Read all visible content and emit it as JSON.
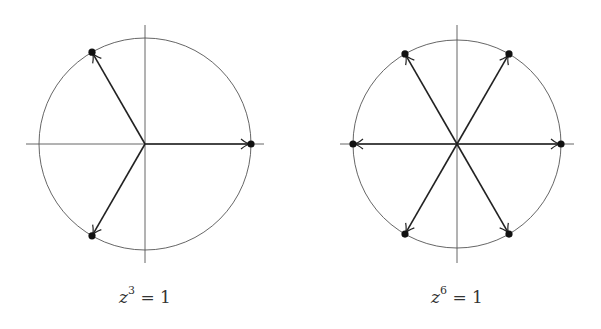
{
  "colors": {
    "circle": "#555555",
    "axis": "#555555",
    "arrow": "#222222",
    "point": "#111111",
    "background": "#ffffff"
  },
  "diagrams": [
    {
      "id": "cube-roots",
      "label": {
        "var": "z",
        "exp": "3",
        "rest": " = 1"
      },
      "n": 3,
      "center": [
        145,
        144
      ],
      "radius": 106,
      "points_deg": [
        0,
        120,
        240
      ]
    },
    {
      "id": "sixth-roots",
      "label": {
        "var": "z",
        "exp": "6",
        "rest": " = 1"
      },
      "n": 6,
      "center": [
        457,
        144
      ],
      "radius": 104,
      "points_deg": [
        0,
        60,
        120,
        180,
        240,
        300
      ]
    }
  ]
}
